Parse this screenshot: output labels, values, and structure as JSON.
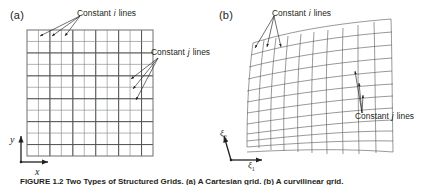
{
  "figure": {
    "panels": [
      {
        "id": "a",
        "label": "(a)",
        "type": "cartesian-grid",
        "annotations": [
          {
            "id": "a-i",
            "prefix": "Constant",
            "index": "i",
            "suffix": "lines"
          },
          {
            "id": "a-j",
            "prefix": "Constant",
            "index": "j",
            "suffix": "lines"
          }
        ],
        "axes": [
          {
            "id": "a-y",
            "label": "y",
            "orientation": "vertical"
          },
          {
            "id": "a-x",
            "label": "x",
            "orientation": "horizontal"
          }
        ]
      },
      {
        "id": "b",
        "label": "(b)",
        "type": "curvilinear-grid",
        "annotations": [
          {
            "id": "b-i",
            "prefix": "Constant",
            "index": "i",
            "suffix": "lines"
          },
          {
            "id": "b-j",
            "prefix": "Constant",
            "index": "j",
            "suffix": "lines"
          }
        ],
        "axes": [
          {
            "id": "b-xi2",
            "label": "ξ",
            "subscript": "2",
            "orientation": "vertical"
          },
          {
            "id": "b-xi1",
            "label": "ξ",
            "subscript": "1",
            "orientation": "horizontal"
          }
        ]
      }
    ],
    "caption": "FIGURE 1.2  Two Types of Structured Grids. (a) A Cartesian grid. (b) A curvilinear grid.",
    "colors": {
      "ink": "#231f20",
      "grid_line": "#6d6e71",
      "grid_line_major": "#3f3f41",
      "background": "#ffffff"
    },
    "grid_a": {
      "columns": 11,
      "rows": 11,
      "left": 27,
      "top": 30,
      "right": 153,
      "bottom": 156
    },
    "grid_b": {
      "columns": 11,
      "rows": 11
    }
  }
}
